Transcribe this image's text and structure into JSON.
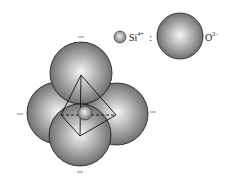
{
  "legend": {
    "si": {
      "symbol": "Si",
      "charge": "4+",
      "separator": ":"
    },
    "o": {
      "symbol": "O",
      "charge": "2−"
    }
  },
  "colors": {
    "sphere_light": "#f4f4f4",
    "sphere_mid": "#a9a9a9",
    "sphere_dark": "#5a5a5a",
    "outline": "#1a1a1a",
    "line": "#111111",
    "background": "#ffffff"
  },
  "structure": {
    "name": "SiO4 tetrahedron",
    "oxygen_spheres": [
      {
        "id": "top",
        "cx": 81,
        "cy": 73,
        "r": 31
      },
      {
        "id": "left",
        "cx": 58,
        "cy": 113,
        "r": 31
      },
      {
        "id": "right",
        "cx": 117,
        "cy": 114,
        "r": 31
      },
      {
        "id": "front",
        "cx": 80,
        "cy": 135,
        "r": 31
      }
    ],
    "silicon_sphere": {
      "cx": 85,
      "cy": 113,
      "r": 7
    },
    "tetrahedron_vertices": {
      "apex": [
        81,
        75
      ],
      "left": [
        61,
        115
      ],
      "right": [
        116,
        115
      ],
      "front": [
        80,
        136
      ]
    },
    "charge_marks": [
      {
        "position": "top",
        "x1": 78,
        "y1": 37,
        "x2": 84,
        "y2": 37
      },
      {
        "position": "left",
        "x1": 17,
        "y1": 114,
        "x2": 23,
        "y2": 114
      },
      {
        "position": "right",
        "x1": 150,
        "y1": 112,
        "x2": 156,
        "y2": 112
      },
      {
        "position": "bottom",
        "x1": 77,
        "y1": 172,
        "x2": 83,
        "y2": 172
      }
    ]
  }
}
